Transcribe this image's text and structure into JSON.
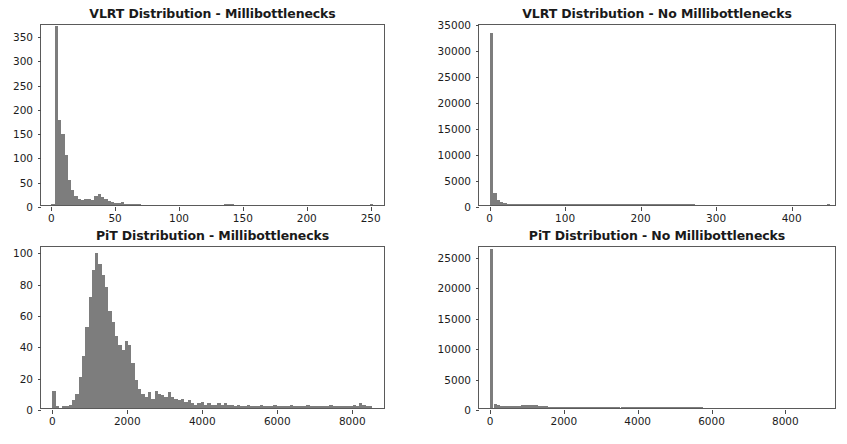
{
  "figure": {
    "width": 847,
    "height": 444,
    "background": "#ffffff",
    "bar_color": "#7d7d7d",
    "axis_color": "#5a5a5a",
    "layout": "2x2 grid of histogram subplots"
  },
  "chart_data": [
    {
      "id": "vlrt-millibottlenecks",
      "type": "bar",
      "subtype": "histogram",
      "title": "VLRT Distribution - Millibottlenecks",
      "xlabel": "",
      "ylabel": "",
      "grid": false,
      "legend": false,
      "xlim": [
        -8,
        262
      ],
      "ylim": [
        0,
        375
      ],
      "xticks": [
        0,
        50,
        100,
        150,
        200,
        250
      ],
      "xtick_labels": [
        "0",
        "50",
        "100",
        "150",
        "200",
        "250"
      ],
      "yticks": [
        0,
        50,
        100,
        150,
        200,
        250,
        300,
        350
      ],
      "ytick_labels": [
        "0",
        "50",
        "100",
        "150",
        "200",
        "250",
        "300",
        "350"
      ],
      "bin_width": 2.6,
      "bin_starts": [
        0,
        2.6,
        5.2,
        7.8,
        10.4,
        13,
        15.6,
        18.2,
        20.8,
        23.4,
        26,
        28.6,
        31.2,
        33.8,
        36.4,
        39,
        41.6,
        44.2,
        46.8,
        49.4,
        52,
        54.6,
        57.2,
        59.8,
        62.4,
        65,
        67.6,
        70.2,
        72.8,
        75.4,
        78,
        80.6,
        83.2,
        85.8,
        88.4,
        91,
        93.6,
        96.2,
        98.8,
        101.4,
        104,
        106.6,
        109.2,
        111.8,
        114.4,
        117,
        119.6,
        122.2,
        124.8,
        127.4,
        130,
        132.6,
        135.2,
        137.8,
        140.4,
        143,
        145.6,
        148.2,
        150.8,
        153.4,
        156,
        158.6,
        161.2,
        163.8,
        166.4,
        169,
        171.6,
        174.2,
        176.8,
        179.4,
        182,
        184.6,
        187.2,
        189.8,
        192.4,
        195,
        197.6,
        200.2,
        202.8,
        205.4,
        208,
        210.6,
        213.2,
        215.8,
        218.4,
        221,
        223.6,
        226.2,
        228.8,
        231.4,
        234,
        236.6,
        239.2,
        241.8,
        244.4,
        247,
        249.6,
        252.2
      ],
      "values": [
        2,
        368,
        176,
        147,
        103,
        52,
        30,
        19,
        13,
        11,
        12,
        13,
        10,
        19,
        22,
        16,
        13,
        8,
        6,
        4,
        5,
        7,
        3,
        2,
        1,
        1,
        1,
        0,
        0,
        0,
        0,
        0,
        0,
        0,
        0,
        0,
        0,
        0,
        0,
        0,
        0,
        0,
        0,
        0,
        0,
        0,
        0,
        0,
        0,
        0,
        0,
        0,
        1,
        2,
        1,
        0,
        0,
        0,
        0,
        0,
        0,
        0,
        0,
        0,
        0,
        0,
        0,
        0,
        0,
        0,
        0,
        0,
        0,
        0,
        0,
        0,
        0,
        0,
        0,
        0,
        0,
        0,
        0,
        0,
        0,
        0,
        0,
        0,
        0,
        0,
        0,
        0,
        0,
        0,
        0,
        0,
        1
      ]
    },
    {
      "id": "vlrt-no-millibottlenecks",
      "type": "bar",
      "subtype": "histogram",
      "title": "VLRT Distribution - No Millibottlenecks",
      "xlabel": "",
      "ylabel": "",
      "grid": false,
      "legend": false,
      "xlim": [
        -14,
        460
      ],
      "ylim": [
        0,
        35000
      ],
      "xticks": [
        0,
        100,
        200,
        300,
        400
      ],
      "xtick_labels": [
        "0",
        "100",
        "200",
        "300",
        "400"
      ],
      "yticks": [
        0,
        5000,
        10000,
        15000,
        20000,
        25000,
        30000,
        35000
      ],
      "ytick_labels": [
        "0",
        "5000",
        "10000",
        "15000",
        "20000",
        "25000",
        "30000",
        "35000"
      ],
      "bin_width": 4.6,
      "bin_starts": [
        0,
        4.6,
        9.2,
        13.8,
        18.4,
        23,
        27.6,
        32.2,
        36.8,
        41.4,
        46,
        50.6,
        55.2,
        59.8,
        64.4,
        69,
        73.6,
        78.2,
        82.8,
        87.4,
        92,
        96.6,
        101.2,
        105.8,
        110.4,
        115,
        119.6,
        124.2,
        128.8,
        133.4,
        138,
        142.6,
        147.2,
        151.8,
        156.4,
        161,
        165.6,
        170.2,
        174.8,
        179.4,
        184,
        188.6,
        193.2,
        197.8,
        202.4,
        207,
        211.6,
        216.2,
        220.8,
        225.4,
        230,
        234.6,
        239.2,
        243.8,
        248.4,
        253,
        257.6,
        262.2,
        266.8,
        271.4,
        276,
        280.6,
        285.2,
        289.8,
        294.4,
        299,
        303.6,
        308.2,
        312.8,
        317.4,
        322,
        326.6,
        331.2,
        335.8,
        340.4,
        345,
        349.6,
        354.2,
        358.8,
        363.4,
        368,
        372.6,
        377.2,
        381.8,
        386.4,
        391,
        395.6,
        400.2,
        404.8,
        409.4,
        414,
        418.6,
        423.2,
        427.8,
        432.4,
        437,
        441.6,
        446.2,
        450.8
      ],
      "values": [
        33100,
        2300,
        900,
        520,
        300,
        180,
        120,
        90,
        70,
        60,
        48,
        40,
        30,
        25,
        20,
        18,
        14,
        12,
        10,
        9,
        8,
        7,
        6,
        5,
        5,
        4,
        4,
        3,
        3,
        3,
        2,
        2,
        2,
        2,
        2,
        2,
        1,
        1,
        1,
        1,
        1,
        1,
        1,
        1,
        1,
        1,
        1,
        1,
        1,
        1,
        1,
        1,
        1,
        1,
        1,
        1,
        1,
        1,
        1,
        0,
        0,
        0,
        0,
        0,
        0,
        0,
        0,
        0,
        0,
        0,
        0,
        0,
        0,
        0,
        0,
        0,
        0,
        0,
        0,
        0,
        0,
        0,
        0,
        0,
        0,
        0,
        0,
        0,
        0,
        0,
        0,
        0,
        0,
        0,
        0,
        0,
        0,
        1
      ]
    },
    {
      "id": "pit-millibottlenecks",
      "type": "bar",
      "subtype": "histogram",
      "title": "PiT Distribution - Millibottlenecks",
      "xlabel": "",
      "ylabel": "",
      "grid": false,
      "legend": false,
      "xlim": [
        -300,
        8900
      ],
      "ylim": [
        0,
        104
      ],
      "xticks": [
        0,
        2000,
        4000,
        6000,
        8000
      ],
      "xtick_labels": [
        "0",
        "2000",
        "4000",
        "6000",
        "8000"
      ],
      "yticks": [
        0,
        20,
        40,
        60,
        80,
        100
      ],
      "ytick_labels": [
        "0",
        "20",
        "40",
        "60",
        "80",
        "100"
      ],
      "bin_width": 88,
      "bin_starts": [
        0,
        88,
        176,
        264,
        352,
        440,
        528,
        616,
        704,
        792,
        880,
        968,
        1056,
        1144,
        1232,
        1320,
        1408,
        1496,
        1584,
        1672,
        1760,
        1848,
        1936,
        2024,
        2112,
        2200,
        2288,
        2376,
        2464,
        2552,
        2640,
        2728,
        2816,
        2904,
        2992,
        3080,
        3168,
        3256,
        3344,
        3432,
        3520,
        3608,
        3696,
        3784,
        3872,
        3960,
        4048,
        4136,
        4224,
        4312,
        4400,
        4488,
        4576,
        4664,
        4752,
        4840,
        4928,
        5016,
        5104,
        5192,
        5280,
        5368,
        5456,
        5544,
        5632,
        5720,
        5808,
        5896,
        5984,
        6072,
        6160,
        6248,
        6336,
        6424,
        6512,
        6600,
        6688,
        6776,
        6864,
        6952,
        7040,
        7128,
        7216,
        7304,
        7392,
        7480,
        7568,
        7656,
        7744,
        7832,
        7920,
        8008,
        8096,
        8184,
        8272,
        8360,
        8448
      ],
      "values": [
        11,
        1,
        0,
        1,
        1,
        2,
        5,
        9,
        20,
        33,
        52,
        71,
        88,
        99,
        92,
        85,
        77,
        62,
        55,
        46,
        40,
        37,
        43,
        40,
        29,
        18,
        12,
        9,
        7,
        10,
        6,
        11,
        9,
        8,
        7,
        10,
        7,
        6,
        5,
        6,
        4,
        5,
        3,
        2,
        3,
        4,
        2,
        3,
        2,
        2,
        3,
        2,
        3,
        2,
        2,
        1,
        2,
        1,
        1,
        2,
        1,
        1,
        1,
        2,
        1,
        1,
        1,
        2,
        1,
        1,
        1,
        1,
        2,
        1,
        1,
        1,
        1,
        2,
        1,
        1,
        1,
        1,
        1,
        1,
        2,
        1,
        1,
        1,
        1,
        1,
        1,
        2,
        1,
        3,
        2,
        1,
        1
      ]
    },
    {
      "id": "pit-no-millibottlenecks",
      "type": "bar",
      "subtype": "histogram",
      "title": "PiT Distribution - No Millibottlenecks",
      "xlabel": "",
      "ylabel": "",
      "grid": false,
      "legend": false,
      "xlim": [
        -300,
        9400
      ],
      "ylim": [
        0,
        26800
      ],
      "xticks": [
        0,
        2000,
        4000,
        6000,
        8000
      ],
      "xtick_labels": [
        "0",
        "2000",
        "4000",
        "6000",
        "8000"
      ],
      "yticks": [
        0,
        5000,
        10000,
        15000,
        20000,
        25000
      ],
      "ytick_labels": [
        "0",
        "5000",
        "10000",
        "15000",
        "20000",
        "25000"
      ],
      "bin_width": 93,
      "bin_starts": [
        0,
        93,
        186,
        279,
        372,
        465,
        558,
        651,
        744,
        837,
        930,
        1023,
        1116,
        1209,
        1302,
        1395,
        1488,
        1581,
        1674,
        1767,
        1860,
        1953,
        2046,
        2139,
        2232,
        2325,
        2418,
        2511,
        2604,
        2697,
        2790,
        2883,
        2976,
        3069,
        3162,
        3255,
        3348,
        3441,
        3534,
        3627,
        3720,
        3813,
        3906,
        3999,
        4092,
        4185,
        4278,
        4371,
        4464,
        4557,
        4650,
        4743,
        4836,
        4929,
        5022,
        5115,
        5208,
        5301,
        5394,
        5487,
        5580,
        5673,
        5766,
        5859,
        5952,
        6045,
        6138,
        6231,
        6324,
        6417,
        6510,
        6603,
        6696,
        6789,
        6882,
        6975,
        7068,
        7161,
        7254,
        7347,
        7440,
        7533,
        7626,
        7719,
        7812,
        7905,
        7998,
        8091,
        8184,
        8277,
        8370,
        8463,
        8556,
        8649,
        8742,
        8835,
        8928
      ],
      "values": [
        26200,
        700,
        430,
        380,
        360,
        340,
        350,
        370,
        400,
        430,
        460,
        480,
        470,
        450,
        400,
        340,
        260,
        190,
        130,
        90,
        60,
        40,
        28,
        20,
        15,
        12,
        10,
        8,
        7,
        6,
        5,
        5,
        4,
        4,
        3,
        3,
        3,
        2,
        2,
        2,
        2,
        2,
        2,
        1,
        1,
        1,
        1,
        1,
        1,
        1,
        1,
        1,
        1,
        1,
        1,
        1,
        1,
        1,
        1,
        1,
        1,
        1,
        0,
        0,
        0,
        0,
        0,
        0,
        0,
        0,
        0,
        0,
        0,
        0,
        0,
        0,
        0,
        0,
        0,
        0,
        0,
        0,
        0,
        0,
        0,
        0,
        0,
        0,
        0,
        0,
        0,
        0,
        0,
        0,
        0,
        0,
        0
      ]
    }
  ],
  "subplot_geometry": [
    {
      "title_left": 40,
      "title_width": 345,
      "title_top": 6,
      "axes_left": 40,
      "axes_top": 24,
      "axes_width": 345,
      "axes_height": 182
    },
    {
      "title_left": 478,
      "title_width": 358,
      "title_top": 6,
      "axes_left": 478,
      "axes_top": 24,
      "axes_width": 358,
      "axes_height": 182
    },
    {
      "title_left": 40,
      "title_width": 345,
      "title_top": 228,
      "axes_left": 40,
      "axes_top": 246,
      "axes_width": 345,
      "axes_height": 163
    },
    {
      "title_left": 478,
      "title_width": 358,
      "title_top": 228,
      "axes_left": 478,
      "axes_top": 246,
      "axes_width": 358,
      "axes_height": 163
    }
  ]
}
